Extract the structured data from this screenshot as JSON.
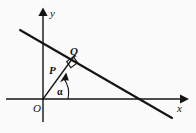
{
  "figure": {
    "background_color": "#fbfbfb",
    "stroke_color": "#141414",
    "axes": {
      "x_label": "x",
      "y_label": "y",
      "origin_label": "O",
      "x_axis": {
        "x1": 6,
        "y1": 99,
        "x2": 186,
        "y2": 99,
        "arrow": "right"
      },
      "y_axis": {
        "x1": 43,
        "y1": 122,
        "x2": 43,
        "y2": 9,
        "arrow": "up"
      }
    },
    "points": [
      {
        "name": "O",
        "label": "O",
        "x": 43,
        "y": 99
      },
      {
        "name": "P",
        "label": "P",
        "x": 58,
        "y": 74
      },
      {
        "name": "Q",
        "label": "Q",
        "x": 73,
        "y": 57
      }
    ],
    "angle": {
      "label": "α",
      "vertex": "O",
      "from": "positive x-axis",
      "to": "ray OQ",
      "degrees": 49
    },
    "segments": [
      {
        "name": "oblique-line",
        "x1": 20,
        "y1": 30,
        "x2": 172,
        "y2": 118
      },
      {
        "name": "ray-OQ",
        "x1": 43,
        "y1": 99,
        "x2": 75,
        "y2": 55
      }
    ],
    "markers": {
      "right_angle_at": "Q",
      "ray_arrow_at": {
        "x": 62,
        "y": 80
      }
    }
  }
}
